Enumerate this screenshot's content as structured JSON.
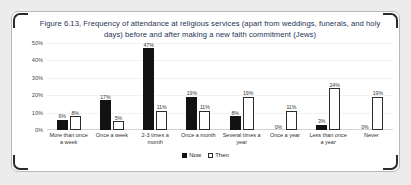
{
  "figure": {
    "title": "Figure 6.13, Frequency of attendance at religious services (apart from weddings, funerals, and holy days) before and after making a new faith commitment (Jews)"
  },
  "legend": {
    "now_label": "Now",
    "then_label": "Then"
  },
  "chart_data": {
    "type": "bar",
    "title": "Figure 6.13, Frequency of attendance at religious services (apart from weddings, funerals, and holy days) before and after making a new faith commitment (Jews)",
    "xlabel": "",
    "ylabel": "",
    "ylim": [
      0,
      50
    ],
    "yticks": [
      0,
      10,
      20,
      30,
      40,
      50
    ],
    "ytick_labels": [
      "0%",
      "10%",
      "20%",
      "30%",
      "40%",
      "50%"
    ],
    "grid": true,
    "legend_position": "bottom",
    "categories": [
      "More than once a week",
      "Once a week",
      "2-3 times a month",
      "Once a month",
      "Several times a year",
      "Once a year",
      "Less than once a year",
      "Never"
    ],
    "series": [
      {
        "name": "Now",
        "color": "#121212",
        "values": [
          6,
          17,
          47,
          19,
          8,
          0,
          3,
          0
        ],
        "labels": [
          "6%",
          "17%",
          "47%",
          "19%",
          "8%",
          "0%",
          "3%",
          "0%"
        ]
      },
      {
        "name": "Then",
        "color": "#ffffff",
        "values": [
          8,
          5,
          11,
          11,
          19,
          11,
          24,
          19
        ],
        "labels": [
          "8%",
          "5%",
          "11%",
          "11%",
          "19%",
          "11%",
          "24%",
          "19%"
        ]
      }
    ]
  }
}
